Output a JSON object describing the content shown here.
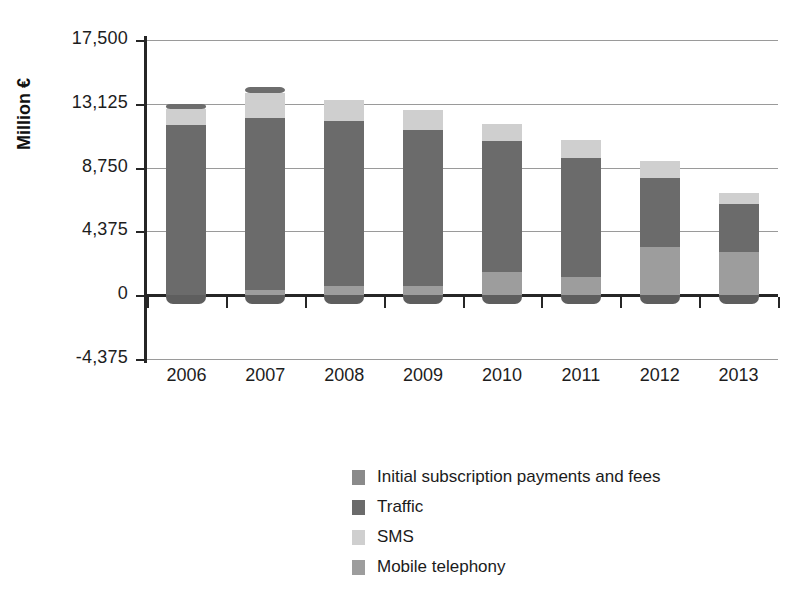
{
  "chart_data": {
    "type": "bar",
    "subtype": "stacked-column",
    "title": "",
    "xlabel": "",
    "ylabel": "Million €",
    "categories": [
      "2006",
      "2007",
      "2008",
      "2009",
      "2010",
      "2011",
      "2012",
      "2013"
    ],
    "ylim": [
      -4375,
      17500
    ],
    "yticks": [
      -4375,
      0,
      4375,
      8750,
      13125,
      17500
    ],
    "ytick_labels": [
      "-4,375",
      "0",
      "4,375",
      "8,750",
      "13,125",
      "17,500"
    ],
    "grid": true,
    "legend_position": "bottom-center",
    "stack_order_bottom_to_top": [
      "Mobile telephony",
      "Traffic",
      "SMS",
      "Initial subscription payments and fees"
    ],
    "series": [
      {
        "name": "Mobile telephony",
        "color": "#9d9d9d",
        "values": [
          0,
          330,
          620,
          640,
          1570,
          1240,
          3300,
          2950
        ]
      },
      {
        "name": "Traffic",
        "color": "#6b6b6b",
        "values": [
          11660,
          11810,
          11310,
          10680,
          9000,
          8160,
          4730,
          3290
        ]
      },
      {
        "name": "SMS",
        "color": "#cfcfcf",
        "values": [
          1100,
          1710,
          1450,
          1370,
          1170,
          1240,
          1170,
          760
        ]
      },
      {
        "name": "Initial subscription payments and fees",
        "color": "#6d6d6d",
        "values": [
          340,
          420,
          0,
          0,
          0,
          0,
          0,
          0
        ]
      }
    ],
    "totals": [
      13100,
      14270,
      13380,
      12690,
      11740,
      10640,
      9200,
      7000
    ]
  },
  "axis": {
    "y_title": "Million €",
    "y_ticks": [
      {
        "label": "17,500",
        "value": 17500
      },
      {
        "label": "13,125",
        "value": 13125
      },
      {
        "label": "8,750",
        "value": 8750
      },
      {
        "label": "4,375",
        "value": 4375
      },
      {
        "label": "0",
        "value": 0
      },
      {
        "label": "-4,375",
        "value": -4375
      }
    ],
    "x_ticks": [
      "2006",
      "2007",
      "2008",
      "2009",
      "2010",
      "2011",
      "2012",
      "2013"
    ]
  },
  "legend": {
    "items": [
      {
        "label": "Initial subscription payments and fees",
        "color": "#8a8a8a"
      },
      {
        "label": "Traffic",
        "color": "#6b6b6b"
      },
      {
        "label": "SMS",
        "color": "#cfcfcf"
      },
      {
        "label": "Mobile telephony",
        "color": "#9d9d9d"
      }
    ]
  }
}
